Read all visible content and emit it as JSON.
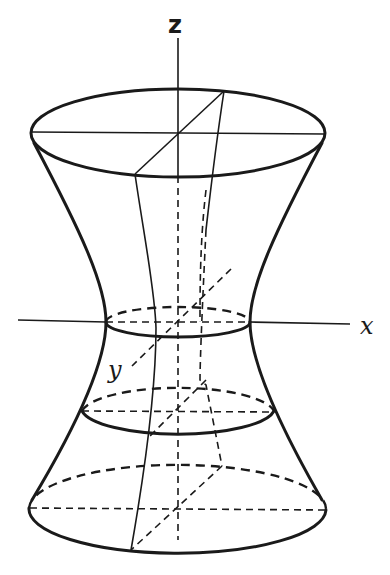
{
  "figure": {
    "axes": {
      "z_label": "z",
      "x_label": "x",
      "y_label": "y"
    },
    "colors": {
      "ink": "#1a1a1a",
      "background": "#ffffff"
    },
    "cross_sections": [
      {
        "name": "top-ellipse",
        "cx": 178,
        "cy": 133,
        "rx": 147,
        "ry": 44
      },
      {
        "name": "waist-ellipse",
        "cx": 178,
        "cy": 322,
        "rx": 72,
        "ry": 15
      },
      {
        "name": "lower-middle-ellipse",
        "cx": 178,
        "cy": 411,
        "rx": 97,
        "ry": 27
      },
      {
        "name": "bottom-ellipse",
        "cx": 178,
        "cy": 508,
        "rx": 148,
        "ry": 44
      }
    ]
  }
}
